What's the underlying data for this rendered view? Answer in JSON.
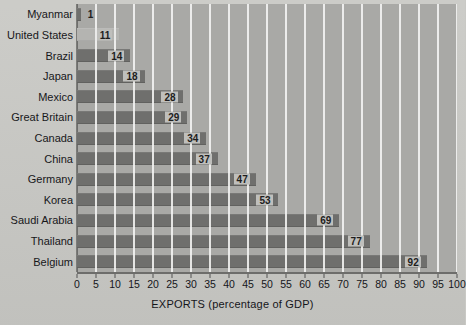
{
  "chart_data": {
    "type": "bar",
    "orientation": "horizontal",
    "title": "",
    "xlabel": "EXPORTS (percentage of GDP)",
    "ylabel": "",
    "xlim": [
      0,
      100
    ],
    "xtick_step": 5,
    "grid": true,
    "legend": false,
    "categories": [
      "Myanmar",
      "United States",
      "Brazil",
      "Japan",
      "Mexico",
      "Great Britain",
      "Canada",
      "China",
      "Germany",
      "Korea",
      "Saudi Arabia",
      "Thailand",
      "Belgium"
    ],
    "values": [
      1,
      11,
      14,
      18,
      28,
      29,
      34,
      37,
      47,
      53,
      69,
      77,
      92
    ],
    "value_labels": [
      "1",
      "11",
      "14",
      "18",
      "28",
      "29",
      "34",
      "37",
      "47",
      "53",
      "69",
      "77",
      "92"
    ],
    "xticks": [
      "0",
      "5",
      "10",
      "15",
      "20",
      "25",
      "30",
      "35",
      "40",
      "45",
      "50",
      "55",
      "60",
      "65",
      "70",
      "75",
      "80",
      "85",
      "90",
      "95",
      "100"
    ]
  },
  "style": {
    "page_background": "#c9c9c5",
    "plot_background": "#a9a9a6",
    "bar_color": "#6f6f6d",
    "bar_color_light": "#b4b4b1",
    "gridline_color": "#ececeb",
    "axis_color": "#6d6d6b",
    "text_color": "#15151a",
    "value_label_background": "#bfbfbc"
  }
}
